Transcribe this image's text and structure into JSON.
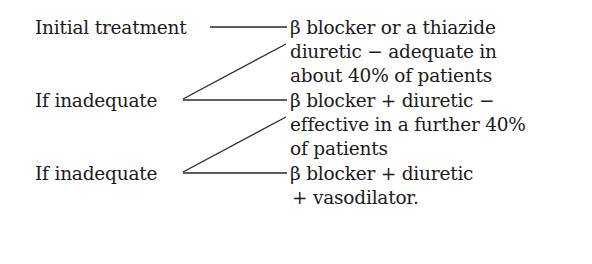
{
  "diagram": {
    "type": "treatment-flowchart",
    "steps": [
      {
        "label": "Initial treatment",
        "result_lines": [
          "β blocker or a thiazide",
          "diuretic − adequate in",
          "about 40% of patients"
        ]
      },
      {
        "label": "If inadequate",
        "result_lines": [
          "β blocker + diuretic −",
          "effective in a further 40%",
          "of patients"
        ]
      },
      {
        "label": "If inadequate",
        "result_lines": [
          "β blocker + diuretic",
          "+ vasodilator."
        ]
      }
    ],
    "colors": {
      "text": "#1a1a1a",
      "line": "#2a2a2a",
      "background": "#ffffff"
    }
  }
}
